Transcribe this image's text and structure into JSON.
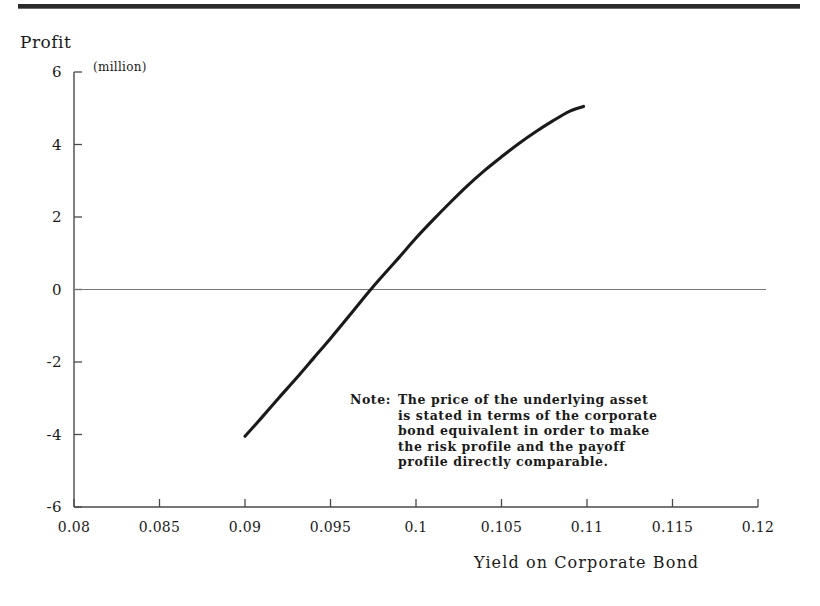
{
  "chart_data": {
    "type": "line",
    "title": "",
    "ylabel": "Profit",
    "yunit": "(million)",
    "xlabel": "Yield on Corporate Bond",
    "xlim": [
      0.08,
      0.12
    ],
    "ylim": [
      -6,
      6
    ],
    "grid": false,
    "legend": "none",
    "xticks": [
      "0.08",
      "0.085",
      "0.09",
      "0.095",
      "0.1",
      "0.105",
      "0.11",
      "0.115",
      "0.12"
    ],
    "xtick_values": [
      0.08,
      0.085,
      0.09,
      0.095,
      0.1,
      0.105,
      0.11,
      0.115,
      0.12
    ],
    "yticks": [
      "6",
      "4",
      "2",
      "0",
      "-2",
      "-4",
      "-6"
    ],
    "ytick_values": [
      6,
      4,
      2,
      0,
      -2,
      -4,
      -6
    ],
    "zero_line": 0,
    "series": [
      {
        "name": "Payoff profile",
        "x": [
          0.09,
          0.091,
          0.092,
          0.093,
          0.094,
          0.095,
          0.096,
          0.097,
          0.0975,
          0.098,
          0.099,
          0.1,
          0.101,
          0.102,
          0.103,
          0.104,
          0.105,
          0.106,
          0.107,
          0.108,
          0.109,
          0.1098
        ],
        "y": [
          -4.05,
          -3.52,
          -2.98,
          -2.45,
          -1.9,
          -1.35,
          -0.78,
          -0.2,
          0.08,
          0.35,
          0.88,
          1.42,
          1.92,
          2.4,
          2.86,
          3.28,
          3.66,
          4.02,
          4.35,
          4.65,
          4.92,
          5.05
        ]
      }
    ],
    "annotations": {
      "note_label": "Note:",
      "note_lines": [
        "The price of the underlying asset",
        "is stated in terms of the corporate",
        "bond equivalent in order to make",
        "the risk profile and the payoff",
        "profile directly comparable."
      ]
    },
    "colors": {
      "curve": "#1a1a1a",
      "axis": "#4a4a4a",
      "zero_line": "#767676",
      "text": "#1a1a1a",
      "rule": "#2b2b2b",
      "background": "#ffffff"
    }
  }
}
